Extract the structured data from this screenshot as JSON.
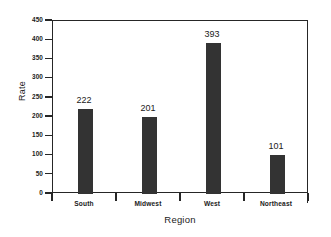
{
  "chart_data": {
    "type": "bar",
    "title": "",
    "xlabel": "Region",
    "ylabel": "Rate",
    "categories": [
      "South",
      "Midwest",
      "West",
      "Northeast"
    ],
    "values": [
      222,
      201,
      393,
      101
    ],
    "value_labels": [
      "222",
      "201",
      "393",
      "101"
    ],
    "ylim": [
      0,
      450
    ],
    "yticks": [
      0,
      50,
      100,
      150,
      200,
      250,
      300,
      350,
      400,
      450
    ],
    "ytick_labels": [
      "0",
      "50",
      "100",
      "150",
      "200",
      "250",
      "300",
      "350",
      "400",
      "450"
    ],
    "grid": false,
    "legend": false,
    "bar_color": "#333333",
    "axis_color": "#262626",
    "background_color": "#ffffff"
  }
}
